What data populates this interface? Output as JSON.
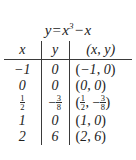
{
  "figure": {
    "title_plain": "y = x^3 - x",
    "title": {
      "lhs": "y",
      "equals": "=",
      "base": "x",
      "exponent": "3",
      "minus": "−",
      "term": "x"
    },
    "background_color": "#ffffff",
    "text_color": "#222222",
    "rule_color": "#3a3a3a"
  },
  "table": {
    "headers": {
      "x": "x",
      "y": "y",
      "xy": "(x, y)"
    },
    "rows": [
      {
        "x": "−1",
        "y": "0",
        "xy": "(−1, 0)",
        "x_is_fraction": false,
        "y_is_fraction": false
      },
      {
        "x": "0",
        "y": "0",
        "xy": "(0, 0)",
        "x_is_fraction": false,
        "y_is_fraction": false
      },
      {
        "x": "1/2",
        "y": "−3/8",
        "xy": "(1/2, −3/8)",
        "x_is_fraction": true,
        "y_is_fraction": true,
        "x_numerator": "1",
        "x_denominator": "2",
        "y_sign": "−",
        "y_numerator": "3",
        "y_denominator": "8"
      },
      {
        "x": "1",
        "y": "0",
        "xy": "(1, 0)",
        "x_is_fraction": false,
        "y_is_fraction": false
      },
      {
        "x": "2",
        "y": "6",
        "xy": "(2, 6)",
        "x_is_fraction": false,
        "y_is_fraction": false
      }
    ]
  },
  "chart_data": {
    "type": "table",
    "xlabel": "x",
    "ylabel": "y",
    "columns": [
      "x",
      "y",
      "(x, y)"
    ],
    "x": [
      -1,
      0,
      0.5,
      1,
      2
    ],
    "values": [
      0,
      0,
      -0.375,
      0,
      6
    ],
    "points": [
      [
        -1,
        0
      ],
      [
        0,
        0
      ],
      [
        0.5,
        -0.375
      ],
      [
        1,
        0
      ],
      [
        2,
        6
      ]
    ],
    "equation": "y = x^3 - x",
    "grid": false,
    "legend": "none"
  }
}
